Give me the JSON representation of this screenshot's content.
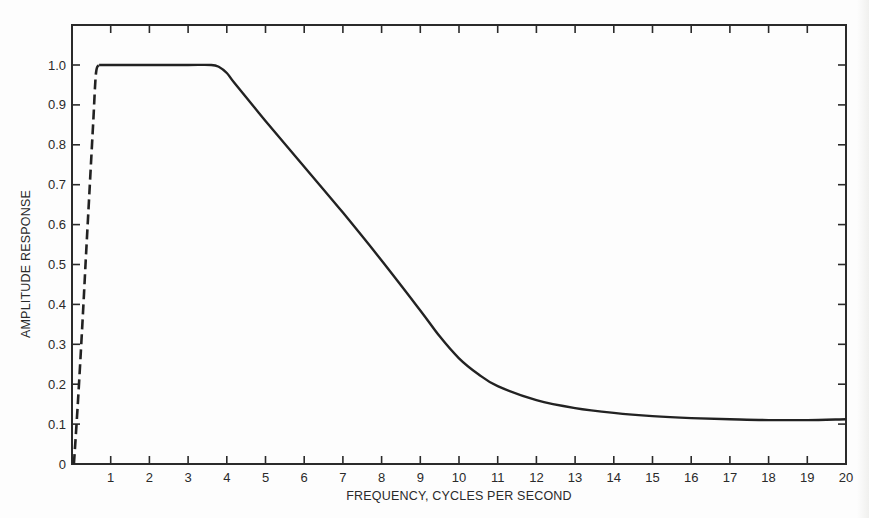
{
  "chart_data": {
    "type": "line",
    "title": "",
    "xlabel": "FREQUENCY, CYCLES PER SECOND",
    "ylabel": "AMPLITUDE RESPONSE",
    "xlim": [
      0,
      20
    ],
    "ylim": [
      0,
      1.1
    ],
    "grid": false,
    "legend": null,
    "x_ticks": [
      1,
      2,
      3,
      4,
      5,
      6,
      7,
      8,
      9,
      10,
      11,
      12,
      13,
      14,
      15,
      16,
      17,
      18,
      19,
      20
    ],
    "y_ticks": [
      0,
      0.1,
      0.2,
      0.3,
      0.4,
      0.5,
      0.6,
      0.7,
      0.8,
      0.9,
      1.0
    ],
    "y_tick_labels": [
      "0",
      "0.1",
      "0.2",
      "0.3",
      "0.4",
      "0.5",
      "0.6",
      "0.7",
      "0.8",
      "0.9",
      "1.0"
    ],
    "series": [
      {
        "name": "low-frequency ramp (dashed)",
        "style": "dashed",
        "x": [
          0.05,
          0.15,
          0.25,
          0.35,
          0.45,
          0.55,
          0.62,
          0.7
        ],
        "y": [
          0.0,
          0.15,
          0.32,
          0.5,
          0.68,
          0.86,
          0.98,
          1.0
        ]
      },
      {
        "name": "amplitude response (solid)",
        "style": "solid",
        "x": [
          0.7,
          1,
          2,
          3,
          3.6,
          3.8,
          4,
          4.2,
          5,
          6,
          7,
          8,
          9,
          9.5,
          10,
          10.5,
          11,
          12,
          13,
          14,
          15,
          16,
          17,
          18,
          19,
          20
        ],
        "y": [
          1.0,
          1.0,
          1.0,
          1.0,
          1.0,
          0.995,
          0.98,
          0.955,
          0.86,
          0.745,
          0.63,
          0.51,
          0.385,
          0.32,
          0.265,
          0.225,
          0.195,
          0.16,
          0.14,
          0.128,
          0.12,
          0.115,
          0.112,
          0.11,
          0.11,
          0.112
        ]
      }
    ]
  },
  "axes": {
    "xlabel": "FREQUENCY, CYCLES PER SECOND",
    "ylabel": "AMPLITUDE RESPONSE"
  }
}
